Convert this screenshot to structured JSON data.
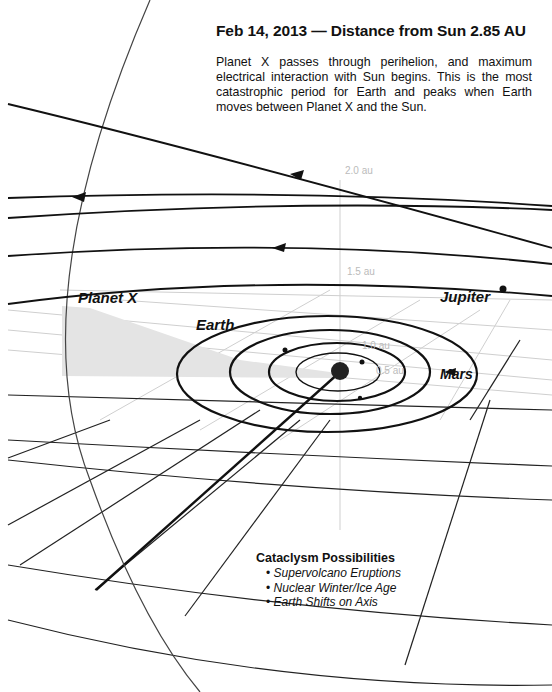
{
  "header": {
    "title": "Feb 14, 2013 — Distance from Sun 2.85 AU",
    "description": "Planet X passes through perihelion, and maximum electrical interaction with Sun begins.  This is the most catastrophic period for Earth and peaks when Earth moves between Planet X and the Sun."
  },
  "labels": {
    "planet_x": "Planet X",
    "earth": "Earth",
    "jupiter": "Jupiter",
    "mars": "Mars"
  },
  "axis_labels": {
    "au_2_0": "2.0 au",
    "au_1_5": "1.5 au",
    "au_1_0": "1.0 au",
    "au_0_5": "0.5 au",
    "au_2_0_right": "2.0 au"
  },
  "cataclysm": {
    "heading": "Cataclysm Possibilities",
    "items": [
      "Supervolcano Eruptions",
      "Nuclear Winter/Ice Age",
      "Earth Shifts on Axis"
    ]
  },
  "colors": {
    "ink": "#111111",
    "grid": "#222222",
    "faint_grid": "#c8c8c8",
    "shadow_wedge": "#e4e4e4"
  }
}
